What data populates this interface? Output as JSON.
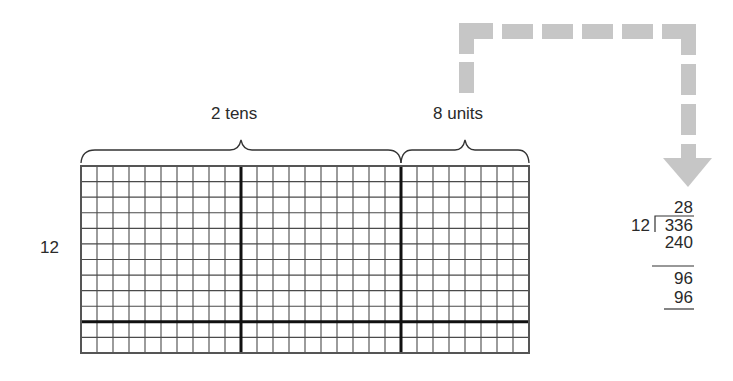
{
  "diagram": {
    "labels": {
      "tens": "2 tens",
      "units": "8 units",
      "rows": "12"
    },
    "grid": {
      "columns": 28,
      "rows": 12,
      "thick_column_dividers": [
        10,
        20
      ],
      "thick_row_divider": 10,
      "line_color": "#4a4a4a",
      "thick_color": "#111111"
    },
    "arrow": {
      "style": "dashed",
      "color": "#c8c8c8",
      "direction": "down"
    },
    "long_division": {
      "divisor": "12",
      "dividend": "336",
      "quotient": "28",
      "step1_product": "240",
      "step1_remainder": "96",
      "step2_product": "96"
    }
  }
}
